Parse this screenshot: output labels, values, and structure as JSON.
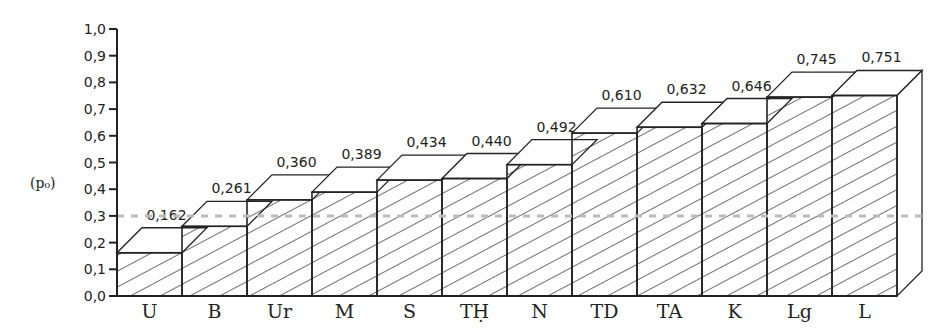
{
  "chart_data": {
    "type": "bar",
    "title": "",
    "xlabel": "",
    "ylabel": "(po)",
    "ylim": [
      0,
      1.0
    ],
    "yticks": [
      "0,0",
      "0,1",
      "0,2",
      "0,3",
      "0,4",
      "0,5",
      "0,6",
      "0,7",
      "0,8",
      "0,9",
      "1,0"
    ],
    "categories": [
      "U",
      "B",
      "Ur",
      "M",
      "S",
      "TḤ",
      "N",
      "TD",
      "TA",
      "K",
      "Lg",
      "L"
    ],
    "values": [
      0.162,
      0.261,
      0.36,
      0.389,
      0.434,
      0.44,
      0.492,
      0.61,
      0.632,
      0.646,
      0.745,
      0.751
    ],
    "value_labels": [
      "0,162",
      "0,261",
      "0,360",
      "0,389",
      "0,434",
      "0,440",
      "0,492",
      "0,610",
      "0,632",
      "0,646",
      "0,745",
      "0,751"
    ],
    "reference_line": {
      "value": 0.3,
      "style": "dashed",
      "color": "#bbbbbb"
    },
    "style": "3d hatched bars",
    "grid": false,
    "legend": null
  },
  "axis": {
    "ylabel": "(p₀)"
  }
}
